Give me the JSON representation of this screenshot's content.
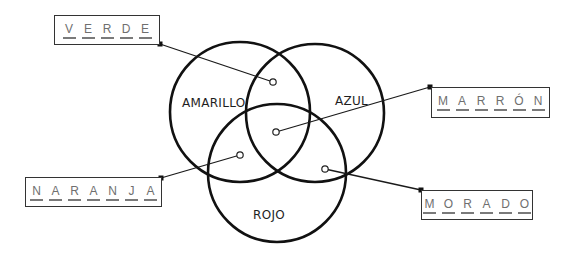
{
  "diagram": {
    "type": "venn",
    "circles": [
      {
        "id": "amarillo",
        "label": "AMARILLO",
        "cx": 240,
        "cy": 112,
        "r": 70,
        "label_x": 182,
        "label_y": 107
      },
      {
        "id": "azul",
        "label": "AZUL",
        "cx": 315,
        "cy": 113,
        "r": 69,
        "label_x": 335,
        "label_y": 105
      },
      {
        "id": "rojo",
        "label": "ROJO",
        "cx": 277,
        "cy": 173,
        "r": 69,
        "label_x": 253,
        "label_y": 219
      }
    ],
    "answer_boxes": [
      {
        "id": "verde",
        "letters": [
          "V",
          "E",
          "R",
          "D",
          "E"
        ],
        "box": {
          "x": 54,
          "y": 15,
          "w": 106,
          "h": 30
        },
        "marker": [
          160,
          44
        ],
        "point": [
          273,
          82
        ]
      },
      {
        "id": "marron",
        "letters": [
          "M",
          "A",
          "R",
          "R",
          "Ó",
          "N"
        ],
        "box": {
          "x": 431,
          "y": 87,
          "w": 119,
          "h": 31
        },
        "marker": [
          430,
          87
        ],
        "point": [
          276,
          132
        ]
      },
      {
        "id": "naranja",
        "letters": [
          "N",
          "A",
          "R",
          "A",
          "N",
          "J",
          "A"
        ],
        "box": {
          "x": 25,
          "y": 177,
          "w": 137,
          "h": 30
        },
        "marker": [
          161,
          178
        ],
        "point": [
          240,
          155
        ]
      },
      {
        "id": "morado",
        "letters": [
          "M",
          "O",
          "R",
          "A",
          "D",
          "O"
        ],
        "box": {
          "x": 421,
          "y": 190,
          "w": 112,
          "h": 30
        },
        "marker": [
          421,
          190
        ],
        "point": [
          325,
          169
        ]
      }
    ]
  }
}
